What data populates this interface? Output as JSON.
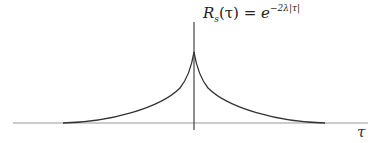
{
  "figure": {
    "formula": {
      "lhs_symbol": "R",
      "lhs_subscript": "s",
      "lhs_arg": "(τ)",
      "equals": " = ",
      "base": "e",
      "exponent": "−2λ|τ|"
    },
    "x_axis_label": "τ",
    "curve_description": "two-sided exponential decay R_s(τ) = e^{-2λ|τ|}, cusp peak at τ = 0",
    "colors": {
      "curve": "#333333",
      "axis": "#999999",
      "vertical_axis": "#444444"
    }
  }
}
